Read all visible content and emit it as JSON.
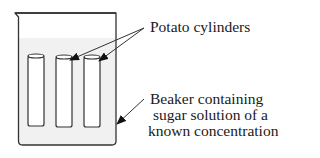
{
  "diagram": {
    "labels": {
      "potato_cylinders": "Potato cylinders",
      "beaker_line1": "Beaker containing",
      "beaker_line2": "sugar solution of a",
      "beaker_line3": "known concentration"
    },
    "components": [
      "beaker",
      "sugar solution",
      "potato cylinder 1",
      "potato cylinder 2",
      "potato cylinder 3"
    ],
    "colors": {
      "outline": "#333333",
      "solution": "#f2f2f2",
      "background": "#ffffff"
    }
  }
}
